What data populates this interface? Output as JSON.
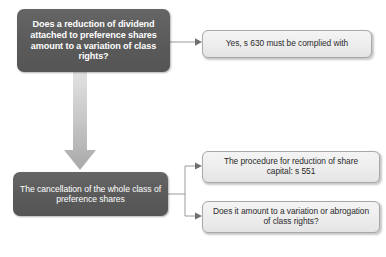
{
  "diagram": {
    "background_color": "#ffffff",
    "dark_node_color": "#5a5a5a",
    "light_node_color": "#ededed",
    "connector_color": "#9a9a9a",
    "big_arrow_color": "#b6b6b6",
    "nodes": {
      "question_dividend": "Does a reduction of dividend attached to preference shares amount to a variation of class rights?",
      "answer_s630": "Yes, s 630 must be complied with",
      "cancellation": "The cancellation of the whole class of preference shares",
      "procedure_s551": "The procedure for reduction of share capital: s 551",
      "question_abrogation": "Does it amount to a variation or abrogation of class rights?"
    }
  }
}
